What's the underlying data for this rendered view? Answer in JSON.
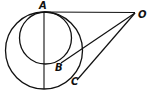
{
  "diagram": {
    "type": "geometry",
    "points": {
      "A": {
        "label": "A",
        "x": 44,
        "y": 12
      },
      "O": {
        "label": "O",
        "x": 135,
        "y": 12
      },
      "B": {
        "label": "B",
        "x": 63,
        "y": 62
      },
      "C": {
        "label": "C",
        "x": 79,
        "y": 77
      }
    },
    "circles": [
      {
        "name": "large",
        "cx": 44,
        "cy": 50.5,
        "r": 38.5
      },
      {
        "name": "small",
        "cx": 45.5,
        "cy": 38,
        "r": 26
      }
    ],
    "stroke_color": "#111111"
  }
}
